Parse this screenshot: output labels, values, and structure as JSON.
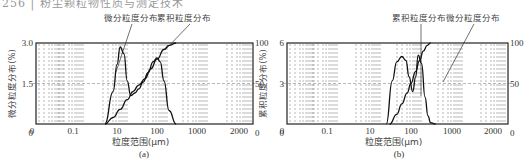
{
  "header": {
    "text": "256 | 粉尘颗粒物性质与测定技术"
  },
  "chart_data": [
    {
      "id": "a",
      "type": "line",
      "caption": "(a)",
      "legend_labels": [
        "微分粒度分布",
        "累积粒度分布"
      ],
      "xlabel": "粒度范围(μm)",
      "ylabel_left": "微分粒度分布(%)",
      "ylabel_right": "",
      "x_tick_labels": [
        "0",
        "0.1",
        "10",
        "100",
        "1000",
        "2000",
        "0"
      ],
      "y_left_ticks": [
        "0",
        "1.5",
        "3.0"
      ],
      "y_right_ticks": [
        "0",
        "50",
        "100"
      ],
      "ylim_left": [
        0,
        3.0
      ],
      "ylim_right": [
        0,
        100
      ],
      "grid": "dashed vertical log-style lines, dashed horizontal midline",
      "series": [
        {
          "name": "微分粒度分布",
          "x_um": [
            5,
            8,
            10,
            12,
            15,
            18,
            22,
            28,
            35,
            45,
            60,
            80,
            100,
            120,
            150,
            200,
            300
          ],
          "y": [
            0,
            1.2,
            2.2,
            2.85,
            2.6,
            1.6,
            1.05,
            1.15,
            1.3,
            1.55,
            1.9,
            2.3,
            2.45,
            2.3,
            1.6,
            0.5,
            0
          ]
        },
        {
          "name": "累积粒度分布",
          "x_um": [
            5,
            8,
            12,
            18,
            25,
            35,
            50,
            70,
            100,
            150,
            200,
            300
          ],
          "y": [
            0,
            8,
            18,
            30,
            40,
            48,
            56,
            68,
            80,
            92,
            97,
            100
          ]
        }
      ]
    },
    {
      "id": "b",
      "type": "line",
      "caption": "(b)",
      "legend_labels": [
        "累积粒度分布",
        "微分粒度分布"
      ],
      "xlabel": "粒度范围(μm)",
      "ylabel_left": "累积粒度分布(%)",
      "ylabel_right": "",
      "x_tick_labels": [
        "0",
        "0.1",
        "10",
        "100",
        "1000",
        "2000",
        "0"
      ],
      "y_left_ticks": [
        "0",
        "3",
        "6"
      ],
      "y_right_ticks": [
        "0",
        "50",
        "100"
      ],
      "ylim_left": [
        0,
        6
      ],
      "ylim_right": [
        0,
        100
      ],
      "grid": "dashed vertical log-style lines, dashed horizontal midline",
      "series": [
        {
          "name": "微分粒度分布",
          "x_um": [
            25,
            35,
            45,
            60,
            75,
            90,
            110,
            130,
            150,
            180,
            220,
            260,
            300,
            400
          ],
          "y": [
            0,
            3.2,
            4.6,
            5.0,
            4.7,
            3.5,
            2.4,
            3.5,
            5.1,
            4.5,
            2.0,
            0.6,
            0.1,
            0
          ]
        },
        {
          "name": "累积粒度分布",
          "x_um": [
            30,
            45,
            60,
            80,
            100,
            130,
            160,
            200,
            250,
            300
          ],
          "y": [
            0,
            12,
            25,
            38,
            50,
            65,
            78,
            90,
            97,
            100
          ]
        }
      ]
    }
  ]
}
